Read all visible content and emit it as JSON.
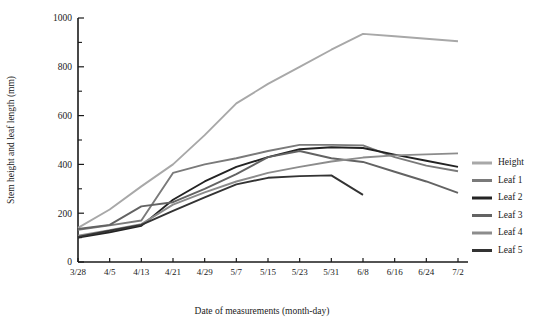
{
  "chart_data": {
    "type": "line",
    "title": "",
    "xlabel": "Date of measurements (month-day)",
    "ylabel": "Stem height and leaf length (mm)",
    "categories": [
      "3/28",
      "4/5",
      "4/13",
      "4/21",
      "4/29",
      "5/7",
      "5/15",
      "5/23",
      "5/31",
      "6/8",
      "6/16",
      "6/24",
      "7/2"
    ],
    "xlim": [
      0,
      12
    ],
    "ylim": [
      0,
      1000
    ],
    "ytick_labels": [
      "0",
      "200",
      "400",
      "600",
      "800",
      "1000"
    ],
    "ytick_values": [
      0,
      200,
      400,
      600,
      800,
      1000
    ],
    "yminor_values": [
      100,
      300,
      500,
      700,
      900
    ],
    "grid": false,
    "legend_position": "right",
    "series": [
      {
        "name": "Height",
        "color": "#a8a8a8",
        "values": [
          140,
          215,
          310,
          400,
          520,
          650,
          730,
          800,
          870,
          935,
          925,
          915,
          905
        ]
      },
      {
        "name": "Leaf 1",
        "color": "#7a7a7a",
        "values": [
          132,
          150,
          170,
          365,
          400,
          425,
          455,
          480,
          480,
          478,
          430,
          395,
          372
        ]
      },
      {
        "name": "Leaf 2",
        "color": "#232323",
        "values": [
          100,
          122,
          148,
          255,
          330,
          390,
          430,
          462,
          470,
          467,
          440,
          415,
          390
        ]
      },
      {
        "name": "Leaf 3",
        "color": "#636363",
        "values": [
          135,
          152,
          228,
          245,
          300,
          360,
          430,
          455,
          425,
          410,
          370,
          330,
          283
        ]
      },
      {
        "name": "Leaf 4",
        "color": "#8c8c8c",
        "values": [
          108,
          130,
          155,
          235,
          285,
          330,
          365,
          390,
          412,
          428,
          437,
          441,
          445
        ]
      },
      {
        "name": "Leaf 5",
        "color": "#333333",
        "values": [
          103,
          128,
          152,
          210,
          265,
          318,
          345,
          352,
          355,
          275,
          null,
          null,
          null
        ]
      }
    ]
  },
  "legend": {
    "items": [
      {
        "label": "Height"
      },
      {
        "label": "Leaf 1"
      },
      {
        "label": "Leaf 2"
      },
      {
        "label": "Leaf 3"
      },
      {
        "label": "Leaf 4"
      },
      {
        "label": "Leaf 5"
      }
    ]
  }
}
